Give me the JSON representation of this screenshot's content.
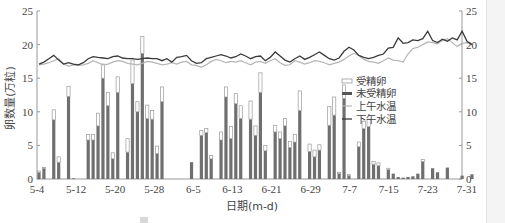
{
  "chart_data": {
    "type": "bar",
    "title": "",
    "xlabel": "日期(m-d)",
    "ylabel": "卵数量(万粒)",
    "y2label": "水温(℃)",
    "ylim": [
      0,
      25
    ],
    "y2lim": [
      0,
      25
    ],
    "yticks": [
      0,
      5,
      10,
      15,
      20,
      25
    ],
    "y2ticks": [
      0,
      5,
      10,
      15,
      20,
      25
    ],
    "grid": false,
    "legend_position": "right-center (inside plot)",
    "x_tick_labels": [
      "5-4",
      "5-12",
      "5-20",
      "5-28",
      "6-5",
      "6-13",
      "6-21",
      "6-29",
      "7-7",
      "7-15",
      "7-23",
      "7-31"
    ],
    "x_start": "5-4",
    "x_end": "7-31",
    "bar_stacking": "未受精卵 (dark) at bottom, 受精卵 (white outline) stacked on top",
    "series": [
      {
        "name": "未受精卵",
        "kind": "bar",
        "color": "#6f6f6f",
        "values": [
          1.0,
          1.6,
          0,
          8.8,
          2.5,
          0,
          12.3,
          0.1,
          0,
          0,
          5.8,
          5.8,
          7.9,
          15.0,
          10.9,
          3.0,
          12.9,
          0,
          4.0,
          14.2,
          10.0,
          18.7,
          9.0,
          8.9,
          3.8,
          11.5,
          0,
          0,
          0,
          0,
          0,
          2.5,
          0,
          6.5,
          6.9,
          3.0,
          0,
          5.8,
          12.2,
          6.0,
          11.2,
          9.0,
          0,
          8.9,
          6.5,
          12.9,
          4.2,
          0,
          7.0,
          6.0,
          7.9,
          4.7,
          5.5,
          10.2,
          0,
          4.1,
          3.3,
          4.3,
          0,
          8.0,
          9.5,
          0.8,
          12.0,
          0.5,
          0,
          4.8,
          7.5,
          7.8,
          2.2,
          2.0,
          0,
          1.4,
          0.8,
          0.3,
          0.2,
          0.3,
          0.4,
          0.8,
          2.6,
          0,
          1.6,
          1.0,
          0,
          1.7,
          0,
          0,
          0.5,
          0,
          0.7
        ],
        "note": "estimated; near-zero late-season days approximated"
      },
      {
        "name": "受精卵",
        "kind": "bar (stacked, white fill)",
        "color": "#ffffff",
        "values": [
          0.2,
          0.1,
          0,
          1.5,
          0.8,
          0,
          1.5,
          0,
          0,
          0,
          0.8,
          0.8,
          1.9,
          2.1,
          2.0,
          0.9,
          2.3,
          0,
          2.0,
          3.5,
          1.5,
          2.5,
          2.0,
          1.3,
          1.1,
          2.2,
          0,
          0,
          0,
          0,
          0,
          0,
          0,
          0.7,
          0.6,
          0.5,
          0,
          1.2,
          1.5,
          1.8,
          1.5,
          1.9,
          0,
          2.7,
          1.4,
          2.9,
          0.8,
          0,
          1.0,
          1.0,
          1.1,
          0.9,
          1.1,
          2.9,
          0,
          1.1,
          1.0,
          0.8,
          0,
          2.8,
          2.7,
          0.2,
          2.0,
          0.2,
          0,
          0.7,
          1.1,
          1.1,
          0.4,
          0.4,
          0,
          0.2,
          0,
          0,
          0,
          0,
          0,
          0,
          0.3,
          0,
          0,
          0,
          0,
          0,
          0,
          0,
          0,
          0,
          0
        ]
      },
      {
        "name": "上午水温",
        "kind": "line",
        "color": "#b5b5b5",
        "values": [
          17.0,
          17.1,
          17.3,
          17.6,
          17.9,
          17.1,
          16.8,
          17.0,
          16.9,
          17.0,
          17.2,
          17.6,
          17.3,
          17.0,
          17.1,
          17.4,
          17.6,
          17.5,
          17.2,
          17.1,
          17.0,
          17.2,
          17.5,
          17.4,
          17.2,
          17.0,
          17.1,
          17.3,
          17.1,
          17.4,
          17.5,
          17.0,
          16.9,
          16.6,
          17.0,
          17.5,
          17.8,
          17.6,
          17.3,
          17.5,
          17.4,
          17.6,
          17.3,
          17.0,
          17.4,
          17.5,
          17.2,
          17.6,
          17.9,
          17.3,
          16.9,
          17.0,
          17.6,
          17.4,
          17.1,
          17.3,
          17.6,
          17.5,
          17.3,
          17.0,
          17.2,
          17.4,
          17.8,
          18.3,
          18.7,
          18.4,
          17.8,
          17.5,
          17.4,
          17.2,
          17.6,
          18.0,
          17.7,
          17.6,
          17.4,
          18.6,
          19.4,
          19.6,
          20.0,
          20.4,
          20.3,
          20.1,
          20.6,
          20.9,
          20.3,
          19.7,
          20.2,
          20.3,
          20.1
        ],
        "note": "approximate trace; y-axis right (水温℃)"
      },
      {
        "name": "下午水温",
        "kind": "line",
        "color": "#3a3a3a",
        "values": [
          17.1,
          17.4,
          17.9,
          18.4,
          17.7,
          17.1,
          17.3,
          17.1,
          17.0,
          17.3,
          17.9,
          18.2,
          18.1,
          18.0,
          17.9,
          18.2,
          18.3,
          18.0,
          17.9,
          17.9,
          17.8,
          17.9,
          18.0,
          17.9,
          17.9,
          17.6,
          17.9,
          17.4,
          18.1,
          18.2,
          18.4,
          17.6,
          17.2,
          17.3,
          17.9,
          18.1,
          18.3,
          18.5,
          18.3,
          18.0,
          18.2,
          18.6,
          18.3,
          17.9,
          18.2,
          18.3,
          17.6,
          18.1,
          18.9,
          18.3,
          17.7,
          17.4,
          17.9,
          18.3,
          17.8,
          18.1,
          18.5,
          18.9,
          18.4,
          17.9,
          17.7,
          18.0,
          19.0,
          19.6,
          19.2,
          18.4,
          18.1,
          17.9,
          18.1,
          18.4,
          18.6,
          19.5,
          19.6,
          21.0,
          20.2,
          20.3,
          20.7,
          20.6,
          20.9,
          22.0,
          20.6,
          20.3,
          20.8,
          20.5,
          21.0,
          20.7,
          22.0,
          20.5,
          20.0
        ],
        "note": "approximate trace; y-axis right (水温℃)"
      }
    ]
  },
  "axes": {
    "left_title": "卵数量(万粒)",
    "right_title": "水温(℃)",
    "x_title": "日期(m-d)",
    "left_ticks": [
      "0",
      "5",
      "10",
      "15",
      "20",
      "25"
    ],
    "right_ticks": [
      "0",
      "5",
      "10",
      "15",
      "20",
      "25"
    ],
    "x_ticks": [
      "5-4",
      "5-12",
      "5-20",
      "5-28",
      "6-5",
      "6-13",
      "6-21",
      "6-29",
      "7-7",
      "7-15",
      "7-23",
      "7-31"
    ]
  },
  "legend": {
    "items": [
      {
        "label": "受精卵",
        "symbol": "open-box"
      },
      {
        "label": "未受精卵",
        "symbol": "thick-dark-bar"
      },
      {
        "label": "上午水温",
        "symbol": "light-line"
      },
      {
        "label": "下午水温",
        "symbol": "dark-line"
      }
    ]
  },
  "colors": {
    "unfertilized": "#6f6f6f",
    "fertilized_stroke": "#9a9a9a",
    "am_temp": "#b5b5b5",
    "pm_temp": "#3a3a3a",
    "axis": "#999999",
    "text": "#444444"
  }
}
